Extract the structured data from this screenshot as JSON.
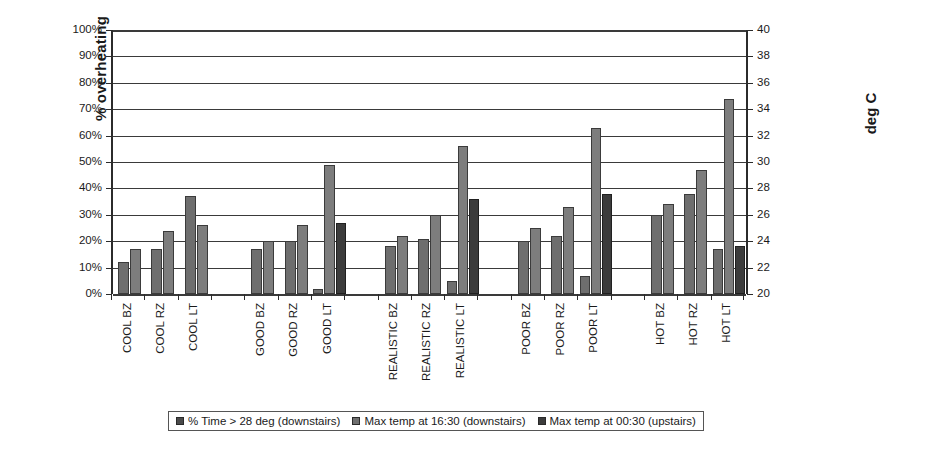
{
  "chart_data": {
    "type": "bar",
    "title": "",
    "xlabel": "",
    "ylabel": "% overheating",
    "ylabel_secondary": "deg C",
    "ylim": [
      0,
      1.0
    ],
    "ylim_secondary": [
      20,
      40
    ],
    "grid": true,
    "legend_position": "bottom",
    "y_ticks": [
      "0%",
      "10%",
      "20%",
      "30%",
      "40%",
      "50%",
      "60%",
      "70%",
      "80%",
      "90%",
      "100%"
    ],
    "y_ticks_secondary": [
      "20",
      "22",
      "24",
      "26",
      "28",
      "30",
      "32",
      "34",
      "36",
      "38",
      "40"
    ],
    "categories": [
      "COOL BZ",
      "COOL RZ",
      "COOL LT",
      "",
      "GOOD BZ",
      "GOOD RZ",
      "GOOD LT",
      "",
      "REALISTIC BZ",
      "REALISTIC RZ",
      "REALISTIC LT",
      "",
      "POOR BZ",
      "POOR RZ",
      "POOR LT",
      "",
      "HOT BZ",
      "HOT RZ",
      "HOT LT"
    ],
    "series": [
      {
        "name": "% Time > 28 deg (downstairs)",
        "axis": "left",
        "unit": "%",
        "color": "#4a4a4a",
        "values": [
          12,
          17,
          0,
          null,
          0,
          0,
          2,
          null,
          0,
          0,
          5,
          null,
          0,
          0,
          7,
          null,
          0,
          0,
          17
        ]
      },
      {
        "name": "Max temp at 16:30 (downstairs)",
        "axis": "right",
        "unit": "deg C",
        "color": "#6e6e6e",
        "values": [
          null,
          null,
          27.4,
          null,
          23.4,
          24.0,
          29.8,
          null,
          23.7,
          24.2,
          31.2,
          null,
          24.0,
          24.4,
          32.6,
          null,
          26.1,
          27.6,
          34.8
        ]
      },
      {
        "name": "Max temp at 00:30 (upstairs)",
        "axis": "right",
        "unit": "deg C",
        "color": "#3c3c3c",
        "values": [
          23.4,
          24.8,
          25.2,
          null,
          24.0,
          25.2,
          25.4,
          null,
          24.4,
          26.0,
          27.2,
          null,
          25.2,
          26.6,
          27.6,
          null,
          27.0,
          29.6,
          34.2
        ]
      }
    ],
    "bars_percent_of_axis": {
      "note": "Plotted bar heights as fraction of the 0-100% left axis, per category, in series order",
      "rows": [
        {
          "cat": "COOL BZ",
          "b1": 12,
          "b2": 17,
          "b3": 0
        },
        {
          "cat": "COOL RZ",
          "b1": 17,
          "b2": 24,
          "b3": 0
        },
        {
          "cat": "COOL LT",
          "b1": 37,
          "b2": 26,
          "b3": 0
        },
        {
          "cat": "",
          "b1": 0,
          "b2": 0,
          "b3": 0
        },
        {
          "cat": "GOOD BZ",
          "b1": 17,
          "b2": 20,
          "b3": 0
        },
        {
          "cat": "GOOD RZ",
          "b1": 20,
          "b2": 26,
          "b3": 0
        },
        {
          "cat": "GOOD LT",
          "b1": 2,
          "b2": 49,
          "b3": 27
        },
        {
          "cat": "",
          "b1": 0,
          "b2": 0,
          "b3": 0
        },
        {
          "cat": "REALISTIC BZ",
          "b1": 18,
          "b2": 22,
          "b3": 0
        },
        {
          "cat": "REALISTIC RZ",
          "b1": 21,
          "b2": 30,
          "b3": 0
        },
        {
          "cat": "REALISTIC LT",
          "b1": 5,
          "b2": 56,
          "b3": 36
        },
        {
          "cat": "",
          "b1": 0,
          "b2": 0,
          "b3": 0
        },
        {
          "cat": "POOR BZ",
          "b1": 20,
          "b2": 25,
          "b3": 0
        },
        {
          "cat": "POOR RZ",
          "b1": 22,
          "b2": 33,
          "b3": 0
        },
        {
          "cat": "POOR LT",
          "b1": 7,
          "b2": 63,
          "b3": 38
        },
        {
          "cat": "",
          "b1": 0,
          "b2": 0,
          "b3": 0
        },
        {
          "cat": "HOT BZ",
          "b1": 30,
          "b2": 34,
          "b3": 0
        },
        {
          "cat": "HOT RZ",
          "b1": 38,
          "b2": 47,
          "b3": 0
        },
        {
          "cat": "HOT LT",
          "b1": 17,
          "b2": 74,
          "b3": 18
        }
      ]
    },
    "legend": [
      "% Time > 28 deg (downstairs)",
      "Max temp at 16:30 (downstairs)",
      "Max temp at 00:30 (upstairs)"
    ]
  }
}
